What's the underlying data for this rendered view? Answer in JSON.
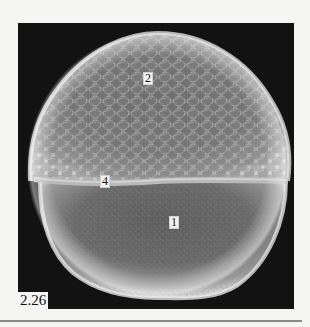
{
  "figure": {
    "number": "2.26",
    "callouts": [
      {
        "id": "2",
        "label": "2",
        "region": "cellular cap (blastoderm)"
      },
      {
        "id": "4",
        "label": "4",
        "region": "margin band"
      },
      {
        "id": "1",
        "label": "1",
        "region": "yolk cell"
      }
    ]
  },
  "colors": {
    "panel_background": "#121212",
    "page_background": "#f5f5f3",
    "label_background": "#f2f2f2",
    "rule": "#8a8a8a"
  }
}
